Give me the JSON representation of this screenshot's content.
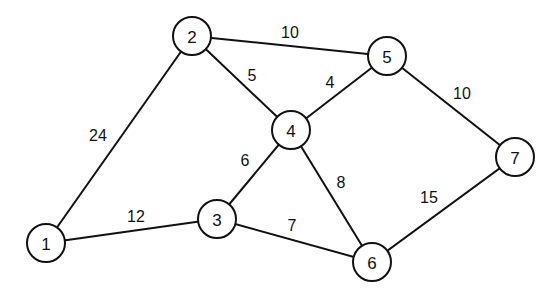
{
  "diagram": {
    "type": "weighted-undirected-graph",
    "colors": {
      "stroke": "#111111",
      "background": "#ffffff",
      "node_fill": "#ffffff"
    },
    "node_radius": 19,
    "nodes": [
      {
        "id": "1",
        "label": "1",
        "x": 46,
        "y": 243
      },
      {
        "id": "2",
        "label": "2",
        "x": 192,
        "y": 36
      },
      {
        "id": "3",
        "label": "3",
        "x": 217,
        "y": 219
      },
      {
        "id": "4",
        "label": "4",
        "x": 291,
        "y": 130
      },
      {
        "id": "5",
        "label": "5",
        "x": 387,
        "y": 56
      },
      {
        "id": "6",
        "label": "6",
        "x": 372,
        "y": 262
      },
      {
        "id": "7",
        "label": "7",
        "x": 515,
        "y": 157
      }
    ],
    "edges": [
      {
        "from": "1",
        "to": "2",
        "weight": "24",
        "label_x": 98,
        "label_y": 135
      },
      {
        "from": "2",
        "to": "5",
        "weight": "10",
        "label_x": 290,
        "label_y": 32
      },
      {
        "from": "2",
        "to": "4",
        "weight": "5",
        "label_x": 252,
        "label_y": 75
      },
      {
        "from": "4",
        "to": "5",
        "weight": "4",
        "label_x": 330,
        "label_y": 82
      },
      {
        "from": "5",
        "to": "7",
        "weight": "10",
        "label_x": 462,
        "label_y": 93
      },
      {
        "from": "3",
        "to": "4",
        "weight": "6",
        "label_x": 245,
        "label_y": 160
      },
      {
        "from": "4",
        "to": "6",
        "weight": "8",
        "label_x": 341,
        "label_y": 182
      },
      {
        "from": "1",
        "to": "3",
        "weight": "12",
        "label_x": 136,
        "label_y": 216
      },
      {
        "from": "3",
        "to": "6",
        "weight": "7",
        "label_x": 292,
        "label_y": 225
      },
      {
        "from": "6",
        "to": "7",
        "weight": "15",
        "label_x": 429,
        "label_y": 197
      }
    ]
  }
}
